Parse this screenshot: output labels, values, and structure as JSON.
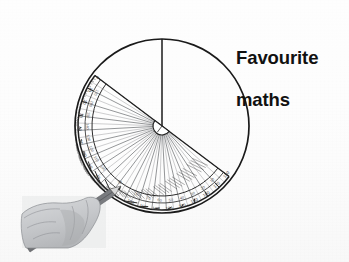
{
  "slide": {
    "width": 349,
    "height": 262,
    "background_color": "#fdfdfd",
    "kind": "hand-drawn geometry illustration on white paper"
  },
  "caption": {
    "line1": "Favourite",
    "line2": "maths",
    "full_text": "Favourite maths",
    "color": "#111111",
    "weight": "bold"
  },
  "diagram": {
    "stroke_color": "#1a1a1a",
    "circle": {
      "label": "large circle outline",
      "center_x": 162,
      "center_y": 126,
      "radius": 87,
      "stroke_width": 1.6
    },
    "radius_line": {
      "label": "vertical radius from centre to top of circle",
      "x1": 162,
      "y1": 126,
      "x2": 162,
      "y2": 39,
      "stroke_width": 1.5
    },
    "protractor": {
      "label": "semicircular protractor",
      "center_x": 162,
      "center_y": 126,
      "outer_radius": 84,
      "inner_radius": 70,
      "hub_radius": 9,
      "rotation_degrees": 37,
      "rotation_note": "baseline tilted clockwise from horizontal",
      "tick_count": 180,
      "major_tick_every": 10,
      "spoke_count": 36,
      "scale_labels": [
        "0",
        "10",
        "20",
        "30",
        "40",
        "50",
        "60",
        "70",
        "80",
        "90",
        "100",
        "110",
        "120",
        "130",
        "140",
        "150",
        "160",
        "170",
        "180"
      ],
      "baseline": {
        "x1": 95,
        "y1": 76,
        "x2": 229,
        "y2": 177
      },
      "body_fill": "rgba(255,255,255,0.55)",
      "rim_color": "#2b2b2b",
      "spoke_color": "#4a4a4a"
    },
    "hand": {
      "label": "grey sketch of a hand holding a pencil",
      "x": 22,
      "y": 194,
      "width": 84,
      "height": 54,
      "fill": "#c9cbcd",
      "outline": "#8d8f92"
    },
    "pencil": {
      "label": "pencil pointing up-right toward protractor rim",
      "tip_x": 118,
      "tip_y": 186,
      "tail_x": 28,
      "tail_y": 250,
      "body_color": "#7a7c80",
      "tip_color": "#3a3a3a"
    }
  }
}
